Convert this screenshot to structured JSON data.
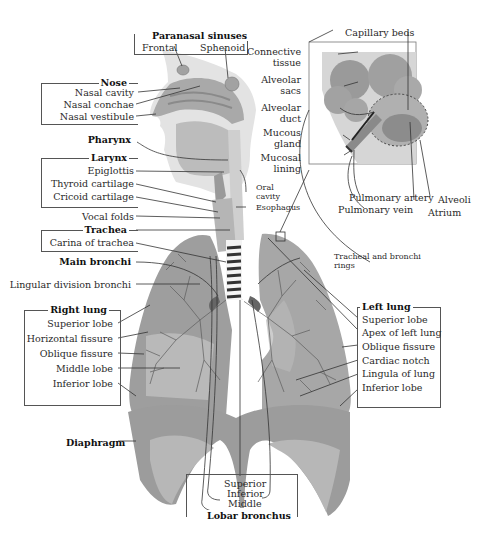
{
  "diagram": {
    "groups": {
      "paranasal_sinuses": {
        "heading": "Paranasal sinuses",
        "items": [
          "Frontal",
          "Sphenoid"
        ]
      },
      "nose": {
        "heading": "Nose",
        "items": [
          "Nasal cavity",
          "Nasal conchae",
          "Nasal vestibule"
        ]
      },
      "pharynx": {
        "heading": "Pharynx"
      },
      "larynx": {
        "heading": "Larynx",
        "items": [
          "Epiglottis",
          "Thyroid cartilage",
          "Cricoid cartilage"
        ]
      },
      "vocal_folds": {
        "label": "Vocal folds"
      },
      "trachea": {
        "heading": "Trachea",
        "items": [
          "Carina of trachea"
        ]
      },
      "main_bronchi": {
        "heading": "Main bronchi"
      },
      "lingular": {
        "label": "Lingular division bronchi"
      },
      "right_lung": {
        "heading": "Right lung",
        "items": [
          "Superior lobe",
          "Horizontal fissure",
          "Oblique fissure",
          "Middle lobe",
          "Inferior lobe"
        ]
      },
      "left_lung": {
        "heading": "Left lung",
        "items": [
          "Superior lobe",
          "Apex of left lung",
          "Oblique fissure",
          "Cardiac notch",
          "Lingula of lung",
          "Inferior lobe"
        ]
      },
      "diaphragm": {
        "heading": "Diaphragm"
      },
      "lobar_bronchus": {
        "heading": "Lobar bronchus",
        "items": [
          "Superior",
          "Inferior",
          "Middle"
        ]
      },
      "oral_cavity": {
        "label": "Oral cavity",
        "line1": "Oral",
        "line2": "cavity"
      },
      "esophagus": {
        "label": "Esophagus"
      },
      "tracheal_rings": {
        "line1": "Tracheal and bronchi",
        "line2": "rings"
      },
      "alveolus_inset": {
        "capillary_beds": "Capillary beds",
        "connective_tissue": [
          "Connective",
          "tissue"
        ],
        "alveolar_sacs": [
          "Alveolar",
          "sacs"
        ],
        "alveolar_duct": [
          "Alveolar",
          "duct"
        ],
        "mucous_gland": [
          "Mucous",
          "gland"
        ],
        "mucosal_lining": [
          "Mucosal",
          "lining"
        ],
        "pulmonary_artery": "Pulmonary artery",
        "pulmonary_vein": "Pulmonary vein",
        "alveoli": "Alveoli",
        "atrium": "Atrium"
      }
    },
    "colors": {
      "tissue_light": "#c8c8c8",
      "tissue_mid": "#a8a8a8",
      "tissue_dark": "#8a8a8a",
      "diaphragm": "#9c9c9c",
      "bronchi": "#555555",
      "line": "#333333"
    }
  }
}
